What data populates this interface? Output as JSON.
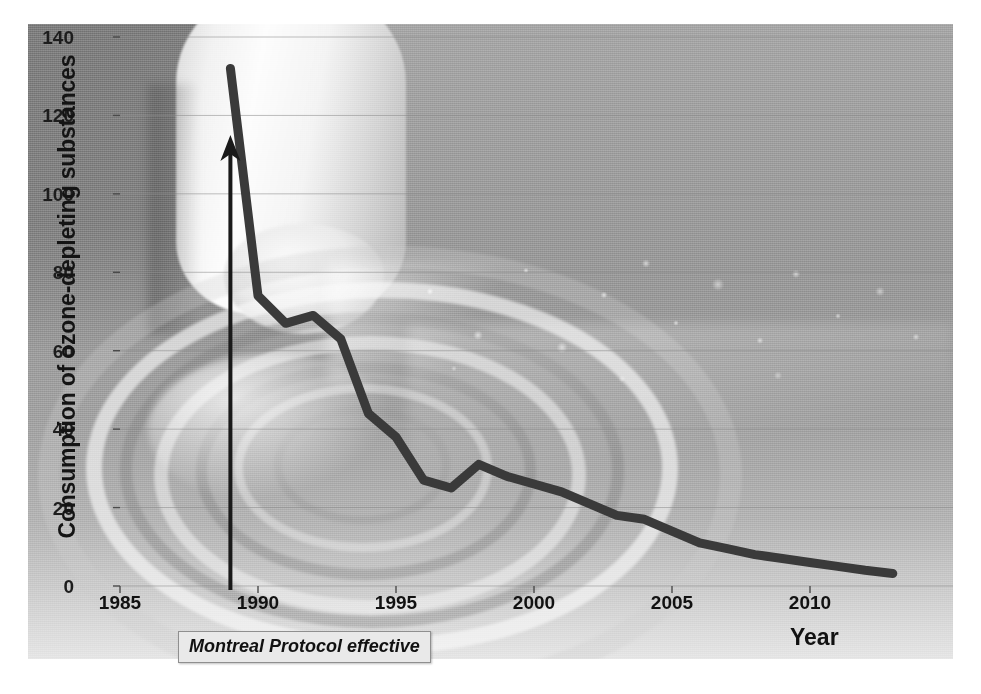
{
  "chart_data": {
    "type": "line",
    "title": "",
    "xlabel": "Year",
    "ylabel": "Consumption of ozone-depleting substances",
    "xlim": [
      1985,
      2013
    ],
    "ylim": [
      0,
      140
    ],
    "xticks": [
      "1985",
      "1990",
      "1995",
      "2000",
      "2005",
      "2010"
    ],
    "yticks": [
      "0",
      "20",
      "40",
      "60",
      "80",
      "100",
      "120",
      "140"
    ],
    "grid": true,
    "legend": "none",
    "series": [
      {
        "name": "Consumption of ozone-depleting substances",
        "color": "#3a3a3a",
        "x": [
          1989,
          1990,
          1991,
          1992,
          1993,
          1994,
          1995,
          1996,
          1997,
          1998,
          1999,
          2000,
          2001,
          2002,
          2003,
          2004,
          2005,
          2006,
          2007,
          2008,
          2009,
          2010,
          2011,
          2012,
          2013
        ],
        "values": [
          132,
          74,
          67,
          69,
          63,
          44,
          38,
          27,
          25,
          31,
          28,
          26,
          24,
          21,
          18,
          17,
          14,
          11,
          9.5,
          8,
          7,
          6,
          5,
          4,
          3.2
        ]
      }
    ],
    "annotations": [
      {
        "name": "montreal-protocol-marker",
        "label": "Montreal Protocol effective",
        "x": 1989,
        "arrow_from_y": 0,
        "arrow_to_y": 115,
        "style": "bold-italic-boxed"
      }
    ]
  },
  "axes": {
    "y_ticks": [
      {
        "label": "140",
        "value": 140
      },
      {
        "label": "120",
        "value": 120
      },
      {
        "label": "100",
        "value": 100
      },
      {
        "label": "80",
        "value": 80
      },
      {
        "label": "60",
        "value": 60
      },
      {
        "label": "40",
        "value": 40
      },
      {
        "label": "20",
        "value": 20
      },
      {
        "label": "0",
        "value": 0
      }
    ],
    "x_ticks": [
      {
        "label": "1985",
        "value": 1985
      },
      {
        "label": "1990",
        "value": 1990
      },
      {
        "label": "1995",
        "value": 1995
      },
      {
        "label": "2000",
        "value": 2000
      },
      {
        "label": "2005",
        "value": 2005
      },
      {
        "label": "2010",
        "value": 2010
      }
    ],
    "y_title": "Consumption of ozone-depleting substances",
    "x_title": "Year"
  },
  "annotation": {
    "text": "Montreal Protocol effective"
  },
  "colors": {
    "line": "#3a3a3a",
    "arrow": "#1a1a1a",
    "grid": "#8a8a8a",
    "tick_text": "#141414",
    "annotation_bg": "#e9e9e9",
    "annotation_border": "#8f8f8f"
  }
}
